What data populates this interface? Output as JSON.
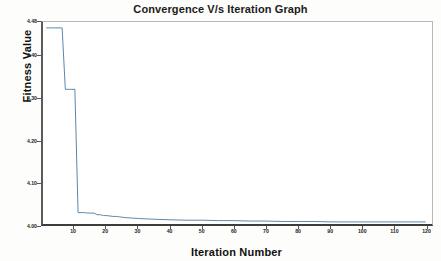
{
  "chart_data": {
    "type": "line",
    "title": "Convergence V/s Iteration Graph",
    "xlabel": "Iteration Number",
    "ylabel": "Fitness Value",
    "grid": false,
    "legend": false,
    "xlim": [
      0,
      122
    ],
    "ylim": [
      4.0,
      4.48
    ],
    "xticks": [
      10,
      20,
      30,
      40,
      50,
      60,
      70,
      80,
      90,
      100,
      110,
      120
    ],
    "xtick_labels": [
      "10",
      "20",
      "30",
      "40",
      "50",
      "60",
      "70",
      "80",
      "90",
      "100",
      "110",
      "120"
    ],
    "yticks": [
      4.0,
      4.1,
      4.2,
      4.3,
      4.4,
      4.48
    ],
    "ytick_labels": [
      "4.00",
      "4.10",
      "4.20",
      "4.30",
      "4.40",
      "4.48"
    ],
    "line_color": "#5b86ad",
    "series": [
      {
        "name": "Best fitness",
        "x": [
          1,
          2,
          3,
          4,
          5,
          6,
          7,
          8,
          9,
          10,
          11,
          12,
          13,
          14,
          15,
          16,
          17,
          18,
          19,
          20,
          21,
          22,
          23,
          24,
          25,
          26,
          28,
          30,
          33,
          36,
          40,
          45,
          50,
          55,
          60,
          65,
          70,
          75,
          80,
          85,
          90,
          95,
          100,
          105,
          110,
          115,
          120
        ],
        "y": [
          4.466,
          4.466,
          4.466,
          4.466,
          4.466,
          4.466,
          4.32,
          4.32,
          4.32,
          4.32,
          4.027,
          4.027,
          4.027,
          4.026,
          4.026,
          4.026,
          4.022,
          4.022,
          4.02,
          4.02,
          4.019,
          4.018,
          4.018,
          4.017,
          4.016,
          4.015,
          4.014,
          4.013,
          4.012,
          4.011,
          4.01,
          4.009,
          4.009,
          4.008,
          4.008,
          4.007,
          4.007,
          4.006,
          4.006,
          4.006,
          4.005,
          4.005,
          4.005,
          4.005,
          4.005,
          4.005,
          4.005
        ]
      }
    ]
  }
}
